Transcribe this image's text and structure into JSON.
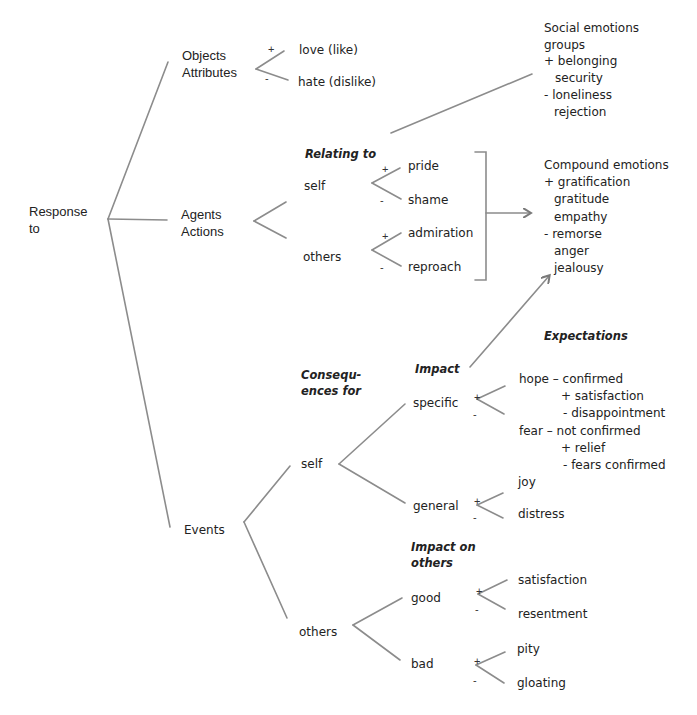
{
  "diagram": {
    "root": {
      "label_line1": "Response",
      "label_line2": "to"
    },
    "objects": {
      "label_line1": "Objects",
      "label_line2": "Attributes",
      "positive": {
        "sign": "+",
        "label": "love (like)"
      },
      "negative": {
        "sign": "-",
        "label": "hate (dislike)"
      }
    },
    "social": {
      "title": "Social emotions",
      "subtitle": "groups",
      "items": [
        "+ belonging",
        "security",
        "-  loneliness",
        "rejection"
      ]
    },
    "agents": {
      "label_line1": "Agents",
      "label_line2": "Actions",
      "heading": "Relating to",
      "self": {
        "label": "self",
        "positive": {
          "sign": "+",
          "label": "pride"
        },
        "negative": {
          "sign": "-",
          "label": "shame"
        }
      },
      "others": {
        "label": "others",
        "positive": {
          "sign": "+",
          "label": "admiration"
        },
        "negative": {
          "sign": "-",
          "label": "reproach"
        }
      }
    },
    "compound": {
      "title": "Compound emotions",
      "items": [
        "+ gratification",
        "gratitude",
        "empathy",
        "- remorse",
        "anger",
        "jealousy"
      ]
    },
    "events": {
      "label": "Events",
      "consequences_heading_line1": "Consequ-",
      "consequences_heading_line2": "ences  for",
      "expectations_heading": "Expectations",
      "self": {
        "label": "self",
        "impact_heading": "Impact",
        "specific": {
          "label": "specific",
          "sign_pos": "+",
          "sign_neg": "-",
          "hope": "hope – confirmed",
          "hope_pos": "+ satisfaction",
          "hope_neg": "- disappointment",
          "fear": "fear – not confirmed",
          "fear_pos": "+ relief",
          "fear_neg": "- fears confirmed"
        },
        "general": {
          "label": "general",
          "positive": {
            "sign": "+",
            "label": "joy"
          },
          "negative": {
            "sign": "-",
            "label": "distress"
          }
        }
      },
      "others": {
        "label": "others",
        "impact_heading_line1": "Impact on",
        "impact_heading_line2": "others",
        "good": {
          "label": "good",
          "positive": {
            "sign": "+",
            "label": "satisfaction"
          },
          "negative": {
            "sign": "-",
            "label": "resentment"
          }
        },
        "bad": {
          "label": "bad",
          "positive": {
            "sign": "+",
            "label": "pity"
          },
          "negative": {
            "sign": "-",
            "label": "gloating"
          }
        }
      }
    }
  },
  "colors": {
    "line": "#8a8a8a",
    "text": "#222222",
    "background": "#ffffff"
  }
}
